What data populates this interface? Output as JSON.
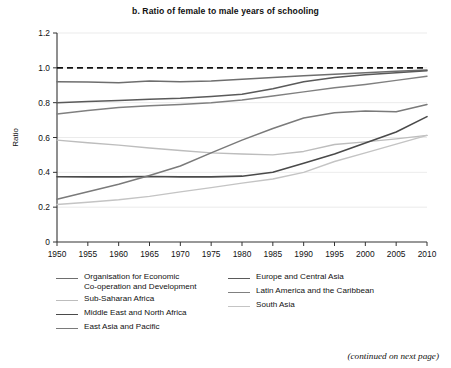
{
  "figure": {
    "title": "b. Ratio of female to male years of schooling",
    "footer": "(continued on next page)"
  },
  "chart_data": {
    "type": "line",
    "title": "b. Ratio of female to male years of schooling",
    "xlabel": "",
    "ylabel": "Ratio",
    "xlim": [
      1950,
      2010
    ],
    "ylim": [
      0,
      1.2
    ],
    "ytick_step": 0.2,
    "grid": "horizontal-light",
    "legend_position": "below",
    "reference_line": {
      "value": 1.0,
      "style": "dashed",
      "color": "#111111"
    },
    "x": [
      1950,
      1955,
      1960,
      1965,
      1970,
      1975,
      1980,
      1985,
      1990,
      1995,
      2000,
      2005,
      2010
    ],
    "xtick_labels": [
      "1950",
      "1955",
      "1960",
      "1965",
      "1970",
      "1975",
      "1980",
      "1985",
      "1990",
      "1995",
      "2000",
      "2005",
      "2010"
    ],
    "ytick_labels": [
      "0",
      "0.2",
      "0.4",
      "0.6",
      "0.8",
      "1.0",
      "1.2"
    ],
    "series": [
      {
        "name": "Organisation for Economic Co-operation and Development",
        "color": "#6e6e6e",
        "width": 1.5,
        "values": [
          0.92,
          0.918,
          0.915,
          0.924,
          0.92,
          0.925,
          0.935,
          0.945,
          0.955,
          0.963,
          0.972,
          0.98,
          0.988
        ]
      },
      {
        "name": "Europe and Central Asia",
        "color": "#5a5a5a",
        "width": 1.5,
        "values": [
          0.8,
          0.806,
          0.812,
          0.82,
          0.826,
          0.836,
          0.848,
          0.88,
          0.92,
          0.945,
          0.96,
          0.972,
          0.983
        ]
      },
      {
        "name": "Sub-Saharan Africa",
        "color": "#bdbdbd",
        "width": 1.4,
        "values": [
          0.585,
          0.57,
          0.556,
          0.54,
          0.525,
          0.512,
          0.505,
          0.5,
          0.52,
          0.56,
          0.575,
          0.592,
          0.612
        ]
      },
      {
        "name": "Latin America and the Caribbean",
        "color": "#808080",
        "width": 1.5,
        "values": [
          0.735,
          0.755,
          0.772,
          0.782,
          0.79,
          0.8,
          0.815,
          0.838,
          0.862,
          0.885,
          0.905,
          0.928,
          0.952
        ]
      },
      {
        "name": "Middle East and North Africa",
        "color": "#4a4a4a",
        "width": 1.6,
        "values": [
          0.375,
          0.374,
          0.374,
          0.376,
          0.374,
          0.374,
          0.378,
          0.4,
          0.452,
          0.505,
          0.568,
          0.632,
          0.72
        ]
      },
      {
        "name": "South Asia",
        "color": "#c4c4c4",
        "width": 1.4,
        "values": [
          0.215,
          0.228,
          0.243,
          0.262,
          0.288,
          0.312,
          0.338,
          0.362,
          0.4,
          0.462,
          0.512,
          0.562,
          0.612
        ]
      },
      {
        "name": "East Asia and Pacific",
        "color": "#7a7a7a",
        "width": 1.5,
        "values": [
          0.245,
          0.288,
          0.332,
          0.382,
          0.436,
          0.512,
          0.585,
          0.652,
          0.712,
          0.742,
          0.752,
          0.748,
          0.79
        ]
      }
    ]
  },
  "legend": {
    "left": [
      {
        "label": "Organisation for Economic\nCo-operation and Development",
        "color": "#6e6e6e",
        "width": 1.6
      },
      {
        "label": "Sub-Saharan Africa",
        "color": "#bdbdbd",
        "width": 1.5
      },
      {
        "label": "Middle East and North Africa",
        "color": "#4a4a4a",
        "width": 1.8
      },
      {
        "label": "East Asia and Pacific",
        "color": "#7a7a7a",
        "width": 1.6
      }
    ],
    "right": [
      {
        "label": "Europe and Central Asia",
        "color": "#5a5a5a",
        "width": 1.6
      },
      {
        "label": "Latin America and the Caribbean",
        "color": "#808080",
        "width": 1.6
      },
      {
        "label": "South Asia",
        "color": "#c4c4c4",
        "width": 1.5
      }
    ]
  }
}
